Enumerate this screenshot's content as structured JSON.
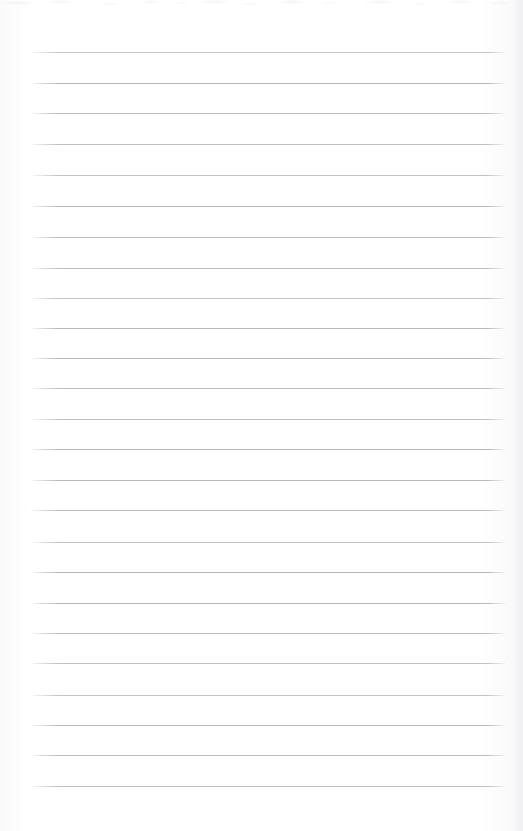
{
  "document": {
    "kind": "blank-lined-page",
    "page_width": 523,
    "page_height": 831,
    "background_color": "#ffffff",
    "has_text": false,
    "has_header": false,
    "has_footer": false,
    "has_page_number": false,
    "has_margin_rule": false
  },
  "ruling": {
    "line_color": "#b6b6bb",
    "line_thickness_px": 1,
    "line_count": 25,
    "left_x": 32,
    "right_x": 505,
    "line_length_px": 473,
    "first_line_y": 52,
    "last_line_y": 786,
    "line_spacing_px": 30.6,
    "top_margin_px": 52,
    "bottom_margin_px": 45,
    "left_margin_px": 32,
    "right_margin_px": 18,
    "line_y_positions": [
      52,
      83,
      113,
      144,
      175,
      206,
      237,
      268,
      298,
      328,
      358,
      388,
      419,
      449,
      480,
      510,
      542,
      572,
      603,
      633,
      663,
      695,
      725,
      755,
      786
    ]
  },
  "scan_artifacts": {
    "top_speckle_band_height_px": 12,
    "right_edge_tint_width_px": 10,
    "right_edge_tint_color": "#f0f0f4"
  }
}
